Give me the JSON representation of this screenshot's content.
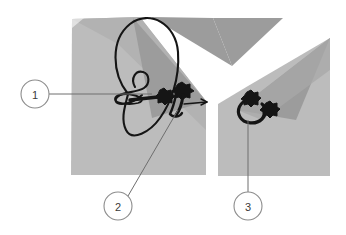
{
  "figure": {
    "background_color": "#ffffff",
    "width": 346,
    "height": 235,
    "colors": {
      "tissue_light": "#bcbcbc",
      "tissue_mid": "#b0b0b0",
      "tissue_dark": "#9c9c9c",
      "structure_outline": "#1a1a1a",
      "leader_line": "#6e6e6e",
      "callout_circle_stroke": "#8c8c8c",
      "callout_circle_fill": "#ffffff",
      "callout_text": "#3a3a3a"
    },
    "panels": [
      {
        "name": "left-panel",
        "description": "Large wedge-shaped tissue block, left side, with dark looping structure",
        "bounds": {
          "x": 71,
          "y": 17,
          "width": 135,
          "height": 158
        }
      },
      {
        "name": "right-panel",
        "description": "Wedge-shaped tissue block, right side, with small dark curled structure",
        "bounds": {
          "x": 218,
          "y": 38,
          "width": 112,
          "height": 138
        }
      }
    ],
    "structures": [
      {
        "name": "large-loop-structure",
        "panel": "left-panel",
        "description": "Large vertical loop with inner spiral and attached floret cluster"
      },
      {
        "name": "floret-cluster-left",
        "panel": "left-panel",
        "description": "Dark floret/branching cluster at the centre of the left panel"
      },
      {
        "name": "small-curl-structure",
        "panel": "right-panel",
        "description": "Small dark hook with two floret tips"
      }
    ],
    "callouts": [
      {
        "id": "callout-1",
        "label": "1",
        "circle": {
          "cx": 35,
          "cy": 94,
          "r": 14
        },
        "leader": {
          "x1": 49,
          "y1": 94,
          "x2": 150,
          "y2": 94
        },
        "points_to": "large-loop-structure"
      },
      {
        "id": "callout-2",
        "label": "2",
        "circle": {
          "cx": 118,
          "cy": 206,
          "r": 14
        },
        "leader": {
          "x1": 128,
          "y1": 196,
          "x2": 178,
          "y2": 112
        },
        "points_to": "floret-cluster-left"
      },
      {
        "id": "callout-3",
        "label": "3",
        "circle": {
          "cx": 248,
          "cy": 206,
          "r": 14
        },
        "leader": {
          "x1": 248,
          "y1": 192,
          "x2": 248,
          "y2": 122
        },
        "points_to": "small-curl-structure"
      }
    ]
  }
}
